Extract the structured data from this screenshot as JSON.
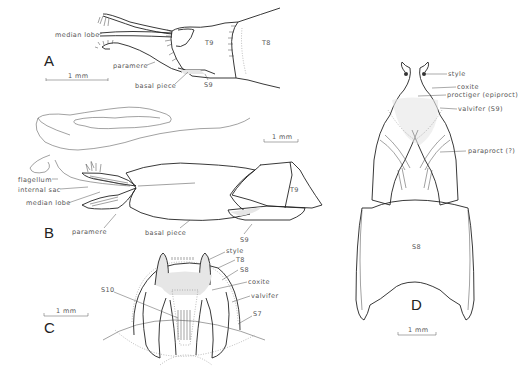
{
  "figure": {
    "panels": {
      "A": {
        "letter": "A",
        "labels": [
          "median lobe",
          "paramere",
          "basal piece",
          "T9",
          "T8",
          "S9"
        ],
        "scale_bar": "1 mm"
      },
      "B": {
        "letter": "B",
        "labels": [
          "flagellum",
          "internal sac",
          "median lobe",
          "paramere",
          "basal piece",
          "T9",
          "S9"
        ],
        "scale_bar": "1 mm"
      },
      "C": {
        "letter": "C",
        "labels": [
          "style",
          "T8",
          "S8",
          "coxite",
          "valvifer",
          "S7",
          "S10"
        ],
        "scale_bar": "1 mm"
      },
      "D": {
        "letter": "D",
        "labels": [
          "style",
          "coxite",
          "proctiger (epiproct)",
          "valvifer (S9)",
          "paraproct (?)",
          "S8"
        ],
        "scale_bar": "1 mm"
      }
    }
  }
}
